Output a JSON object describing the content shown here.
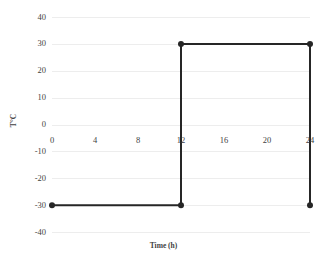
{
  "chart_data": {
    "type": "line",
    "title": "",
    "subtitle": "",
    "xlabel": "Time (h)",
    "ylabel": "T°C",
    "xlim": [
      0,
      24
    ],
    "ylim": [
      -40,
      40
    ],
    "grid": true,
    "grid_axis": "y",
    "legend": false,
    "legend_position": "none",
    "xticks": [
      0,
      4,
      8,
      12,
      16,
      20,
      24
    ],
    "xtick_labels": [
      "0",
      "4",
      "8",
      "12",
      "16",
      "20",
      "24"
    ],
    "yticks": [
      40,
      30,
      20,
      10,
      0,
      -10,
      -20,
      -30,
      -40
    ],
    "ytick_labels": [
      "40",
      "30",
      "20",
      "10",
      "0",
      "-10",
      "-20",
      "-30",
      "-40"
    ],
    "series": [
      {
        "name": "Temperature",
        "color": "#262626",
        "marker": "circle",
        "marker_size": 3,
        "line_width": 2,
        "x": [
          0,
          12,
          12,
          24,
          24
        ],
        "y": [
          -30,
          -30,
          30,
          30,
          -30
        ],
        "points": [
          {
            "x": 0,
            "y": -30
          },
          {
            "x": 12,
            "y": -30
          },
          {
            "x": 12,
            "y": 30
          },
          {
            "x": 24,
            "y": 30
          },
          {
            "x": 24,
            "y": -30
          }
        ]
      }
    ],
    "annotations": []
  },
  "colors": {
    "series": "#262626",
    "gridline": "#ededed",
    "text": "#3f3f3f",
    "background": "#ffffff"
  }
}
